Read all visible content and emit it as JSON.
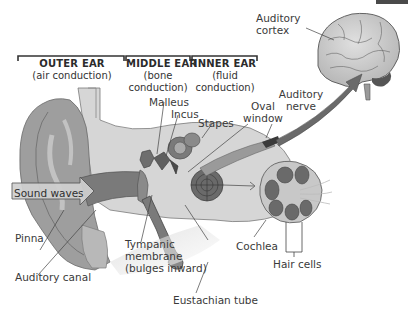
{
  "diagram": {
    "sections": [
      {
        "name": "OUTER EAR",
        "sub": "(air conduction)"
      },
      {
        "name": "MIDDLE EAR",
        "sub1": "(bone",
        "sub2": "conduction)"
      },
      {
        "name": "INNER EAR",
        "sub1": "(fluid",
        "sub2": "conduction)"
      }
    ],
    "labels": {
      "auditory_cortex_1": "Auditory",
      "auditory_cortex_2": "cortex",
      "auditory_nerve_1": "Auditory",
      "auditory_nerve_2": "nerve",
      "oval_window_1": "Oval",
      "oval_window_2": "window",
      "malleus": "Malleus",
      "incus": "Incus",
      "stapes": "Stapes",
      "sound_waves": "Sound waves",
      "pinna": "Pinna",
      "auditory_canal": "Auditory canal",
      "tympanic_1": "Tympanic",
      "tympanic_2": "membrane",
      "tympanic_3": "(bulges inward)",
      "cochlea": "Cochlea",
      "hair_cells": "Hair cells",
      "eustachian_tube": "Eustachian tube"
    },
    "colors": {
      "skin": "#9a9a9a",
      "skin_light": "#bdbdbd",
      "bone": "#d4d4d4",
      "canal": "#7d7d7d",
      "dark": "#5a5a5a",
      "brain": "#cfcfcf",
      "line": "#3a3a3a"
    }
  }
}
